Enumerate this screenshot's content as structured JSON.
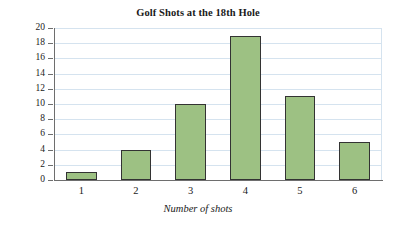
{
  "chart_data": {
    "type": "bar",
    "title": "Golf Shots at the 18th Hole",
    "xlabel": "Number of shots",
    "ylabel": "Number of golfers",
    "categories": [
      "1",
      "2",
      "3",
      "4",
      "5",
      "6"
    ],
    "values": [
      1,
      4,
      10,
      19,
      11,
      5
    ],
    "ylim": [
      0,
      20
    ],
    "ytick_labels": [
      "0",
      "2",
      "4",
      "6",
      "8",
      "10",
      "12",
      "14",
      "16",
      "18",
      "20"
    ],
    "ytick_values": [
      0,
      2,
      4,
      6,
      8,
      10,
      12,
      14,
      16,
      18,
      20
    ],
    "grid": "horizontal",
    "legend": "none",
    "colors": {
      "bar_fill": "#9dc183",
      "bar_border": "#333333",
      "gridline": "#d5e3ef",
      "axis": "#6e6e6e",
      "text": "#1a1a1a",
      "background": "#ffffff"
    }
  }
}
